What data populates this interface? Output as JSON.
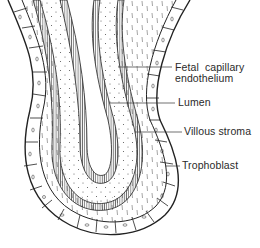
{
  "diagram": {
    "labels": [
      {
        "id": "fetal-capillary-endothelium",
        "line1": "Fetal  capillary",
        "line2": "endothelium"
      },
      {
        "id": "lumen",
        "line1": "Lumen"
      },
      {
        "id": "villous-stroma",
        "line1": "Villous stroma"
      },
      {
        "id": "trophoblast",
        "line1": "Trophoblast"
      }
    ],
    "colors": {
      "ink": "#2a2a2a",
      "background": "#ffffff"
    }
  }
}
